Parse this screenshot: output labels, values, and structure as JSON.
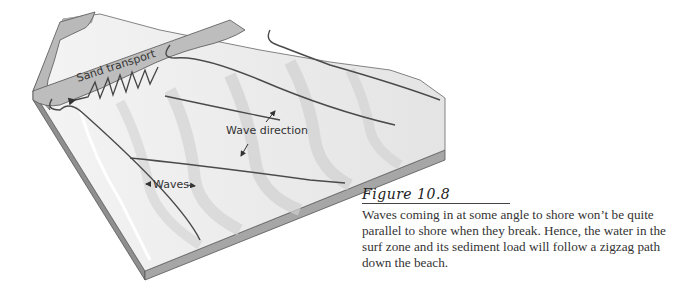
{
  "figure": {
    "title": "Figure 10.8",
    "caption": "Waves coming in at some angle to shore won’t be quite parallel to shore when they break. Hence, the water in the surf zone and its sediment load will follow a zigzag path down the beach."
  },
  "diagram": {
    "labels": {
      "sand_transport": "Sand transport",
      "wave_direction": "Wave direction",
      "waves": "Waves"
    },
    "colors": {
      "beach": "#b9b9b9",
      "water": "#ececec",
      "side": "#9a9a9a",
      "lines": "#4a4a4a"
    }
  }
}
